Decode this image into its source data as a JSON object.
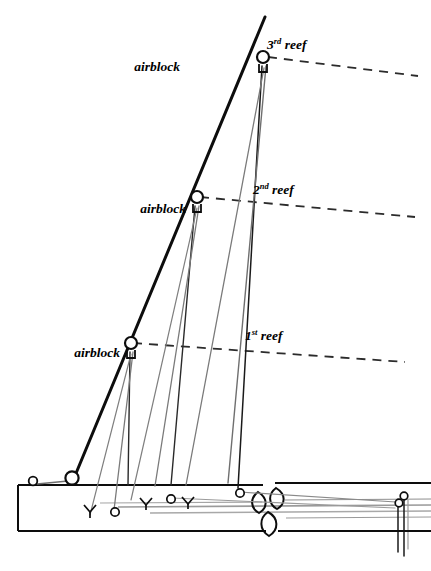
{
  "diagram": {
    "colors": {
      "ink": "#0d0d0d",
      "line_gray": "#8c8c8c",
      "background": "#ffffff"
    },
    "labels": {
      "airblock_top": "airblock",
      "airblock_middle": "airblock",
      "airblock_bottom": "airblock",
      "reef_third_number": "3",
      "reef_third_ordinal": "rd",
      "reef_third_word": " reef",
      "reef_second_number": "2",
      "reef_second_ordinal": "nd",
      "reef_second_word": " reef",
      "reef_first_number": "1",
      "reef_first_ordinal": "st",
      "reef_first_word": " reef"
    },
    "parts": {
      "mast": "mast-luff-spar",
      "boom": "boom",
      "gooseneck": "gooseneck-fitting",
      "reef_line_1": "first-reef-line",
      "reef_line_2": "second-reef-line",
      "reef_line_3": "third-reef-line"
    }
  }
}
